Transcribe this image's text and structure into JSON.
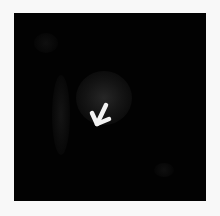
{
  "image": {
    "description": "Dark grayscale image with a faint bright region and a white arrow pointing down-left",
    "background_color": "#020202",
    "frame_color": "#f8f8f8",
    "annotation": {
      "type": "arrow",
      "color": "#f2f2f2",
      "direction": "down-left"
    }
  }
}
